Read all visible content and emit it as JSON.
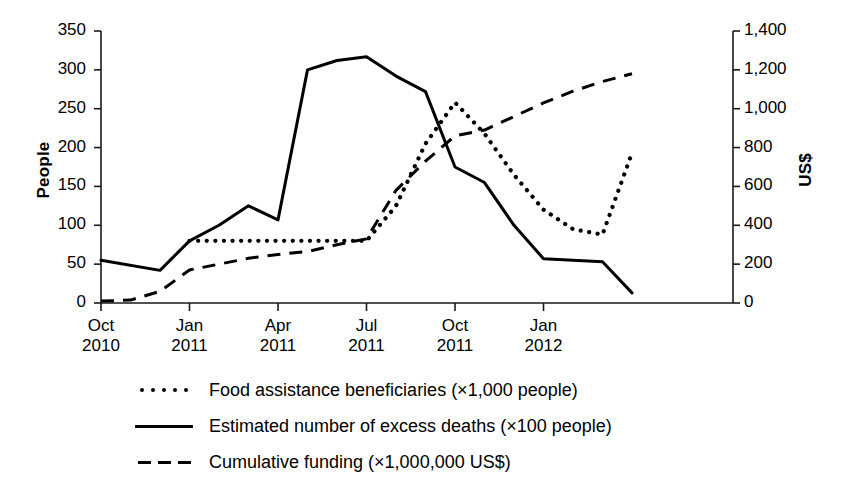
{
  "chart_data": {
    "type": "line",
    "title": "",
    "xlabel": "",
    "ylabel": "People",
    "ylabel_right": "US$",
    "grid": false,
    "legend_position": "bottom",
    "x_tick_labels": [
      {
        "month": "Oct",
        "year": "2010"
      },
      {
        "month": "Jan",
        "year": "2011"
      },
      {
        "month": "Apr",
        "year": "2011"
      },
      {
        "month": "Jul",
        "year": "2011"
      },
      {
        "month": "Oct",
        "year": "2011"
      },
      {
        "month": "Jan",
        "year": "2012"
      }
    ],
    "x_months": [
      "Oct 2010",
      "Nov 2010",
      "Dec 2010",
      "Jan 2011",
      "Feb 2011",
      "Mar 2011",
      "Apr 2011",
      "May 2011",
      "Jun 2011",
      "Jul 2011",
      "Aug 2011",
      "Sep 2011",
      "Oct 2011",
      "Nov 2011",
      "Dec 2011",
      "Jan 2012",
      "Feb 2012",
      "Mar 2012",
      "Apr 2012"
    ],
    "ylim": [
      0,
      350
    ],
    "yticks": [
      "0",
      "50",
      "100",
      "150",
      "200",
      "250",
      "300",
      "350"
    ],
    "ylim_right": [
      0,
      1400
    ],
    "yticks_right": [
      "0",
      "200",
      "400",
      "600",
      "800",
      "1,000",
      "1,200",
      "1,400"
    ],
    "series": [
      {
        "name": "Food assistance beneficiaries (×1,000 people)",
        "style": "dotted",
        "axis": "left",
        "x": [
          "Jan 2011",
          "Feb 2011",
          "Mar 2011",
          "Apr 2011",
          "May 2011",
          "Jun 2011",
          "Jul 2011",
          "Aug 2011",
          "Sep 2011",
          "Oct 2011",
          "Nov 2011",
          "Dec 2011",
          "Jan 2012",
          "Feb 2012",
          "Mar 2012",
          "Apr 2012"
        ],
        "values": [
          80,
          80,
          80,
          80,
          80,
          80,
          80,
          125,
          205,
          258,
          218,
          165,
          120,
          95,
          88,
          193
        ]
      },
      {
        "name": "Estimated number of excess deaths (×100 people)",
        "style": "solid",
        "axis": "left",
        "x": [
          "Oct 2010",
          "Dec 2010",
          "Jan 2011",
          "Feb 2011",
          "Mar 2011",
          "Apr 2011",
          "May 2011",
          "Jun 2011",
          "Jul 2011",
          "Aug 2011",
          "Sep 2011",
          "Oct 2011",
          "Nov 2011",
          "Dec 2011",
          "Jan 2012",
          "Feb 2012",
          "Mar 2012",
          "Apr 2012"
        ],
        "values": [
          55,
          42,
          80,
          100,
          125,
          107,
          300,
          312,
          317,
          292,
          272,
          175,
          155,
          100,
          57,
          55,
          53,
          13
        ]
      },
      {
        "name": "Cumulative funding (×1,000,000 US$)",
        "style": "dashed",
        "axis": "right",
        "x": [
          "Oct 2010",
          "Nov 2010",
          "Dec 2010",
          "Jan 2011",
          "Feb 2011",
          "Mar 2011",
          "Apr 2011",
          "May 2011",
          "Jun 2011",
          "Jul 2011",
          "Aug 2011",
          "Sep 2011",
          "Oct 2011",
          "Nov 2011",
          "Dec 2011",
          "Jan 2012",
          "Feb 2012",
          "Mar 2012",
          "Apr 2012"
        ],
        "values": [
          10,
          15,
          60,
          170,
          200,
          230,
          250,
          265,
          300,
          330,
          580,
          730,
          860,
          890,
          960,
          1030,
          1090,
          1140,
          1180
        ]
      }
    ]
  },
  "legend": {
    "items": [
      {
        "label": "Food assistance beneficiaries (×1,000 people)",
        "style": "dotted"
      },
      {
        "label": "Estimated number of excess deaths (×100 people)",
        "style": "solid"
      },
      {
        "label": "Cumulative funding (×1,000,000 US$)",
        "style": "dashed"
      }
    ]
  },
  "colors": {
    "line": "#000000",
    "axis": "#1a1a1a",
    "background": "#ffffff"
  }
}
